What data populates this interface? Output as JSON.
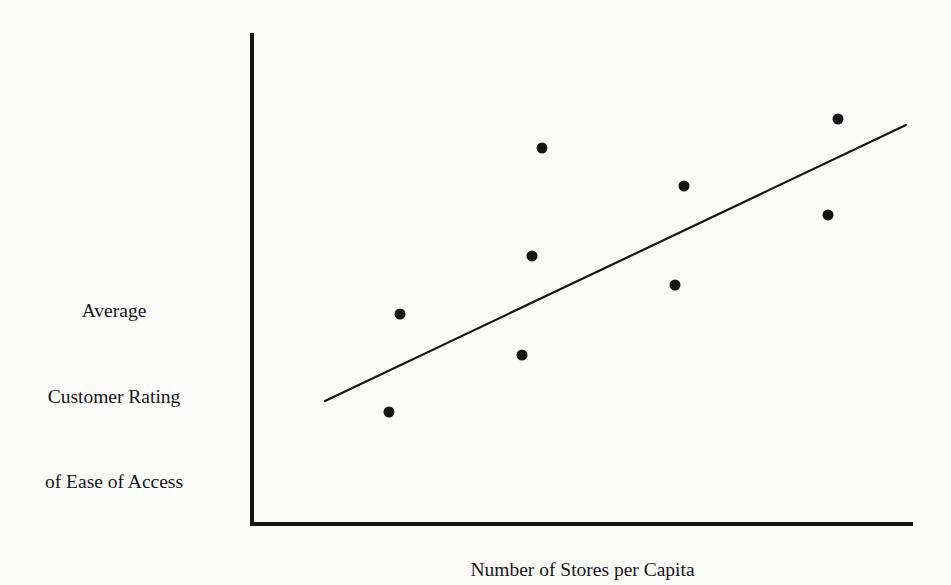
{
  "figure": {
    "background_color": "#fcfcfb",
    "ink_color": "#151515"
  },
  "y_axis_label": {
    "line1": "Average",
    "line2": "Customer Rating",
    "line3": "of Ease of Access"
  },
  "x_axis_label": {
    "text": "Number of Stores per Capita"
  },
  "chart_data": {
    "type": "scatter",
    "title": "",
    "xlabel": "Number of Stores per Capita",
    "ylabel": "Average Customer Rating of Ease of Access",
    "grid": false,
    "legend": null,
    "axis_style": "two-axis L-shape, no tick marks, no tick labels",
    "xlim": [
      0,
      10
    ],
    "ylim": [
      0,
      10
    ],
    "points": [
      {
        "x": 2.24,
        "y": 4.29
      },
      {
        "x": 2.07,
        "y": 2.29
      },
      {
        "x": 4.42,
        "y": 7.7
      },
      {
        "x": 4.27,
        "y": 5.49
      },
      {
        "x": 4.12,
        "y": 3.47
      },
      {
        "x": 6.6,
        "y": 6.92
      },
      {
        "x": 6.46,
        "y": 4.9
      },
      {
        "x": 8.82,
        "y": 8.29
      },
      {
        "x": 8.67,
        "y": 6.33
      }
    ],
    "pixel_points": [
      {
        "cx": 400,
        "cy": 314
      },
      {
        "cx": 389,
        "cy": 412
      },
      {
        "cx": 542,
        "cy": 148
      },
      {
        "cx": 532,
        "cy": 256
      },
      {
        "cx": 522,
        "cy": 355
      },
      {
        "cx": 684,
        "cy": 186
      },
      {
        "cx": 675,
        "cy": 285
      },
      {
        "cx": 838,
        "cy": 119
      },
      {
        "cx": 828,
        "cy": 215
      }
    ],
    "marker": {
      "shape": "circle",
      "radius": 5.5,
      "color": "#151515"
    },
    "trend_line": {
      "description": "straight positive-slope fit line",
      "x1": 325,
      "y1": 401,
      "x2": 906,
      "y2": 125,
      "color": "#151515",
      "width": 2.2
    },
    "annotation": "Positive linear relationship: customer rating of ease of access increases with number of stores per capita."
  }
}
